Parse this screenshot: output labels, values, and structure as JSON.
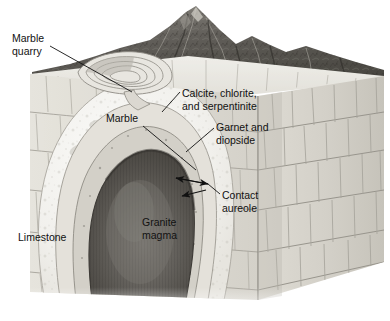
{
  "figure": {
    "background_color": "#ffffff",
    "style": "grayscale halftone textbook illustration"
  },
  "labels": [
    {
      "id": "marble-quarry",
      "text_line1": "Marble",
      "text_line2": "quarry",
      "x": 12,
      "y": 42,
      "anchor": "start"
    },
    {
      "id": "marble",
      "text_line1": "Marble",
      "text_line2": "",
      "x": 106,
      "y": 122,
      "anchor": "start"
    },
    {
      "id": "calcite",
      "text_line1": "Calcite, chlorite,",
      "text_line2": "and serpentinite",
      "x": 182,
      "y": 97,
      "anchor": "start"
    },
    {
      "id": "garnet",
      "text_line1": "Garnet and",
      "text_line2": "diopside",
      "x": 216,
      "y": 131,
      "anchor": "start"
    },
    {
      "id": "contact-aureole",
      "text_line1": "Contact",
      "text_line2": "aureole",
      "x": 222,
      "y": 199,
      "anchor": "start"
    },
    {
      "id": "granite-magma",
      "text_line1": "Granite",
      "text_line2": "magma",
      "x": 142,
      "y": 226,
      "anchor": "start"
    },
    {
      "id": "limestone",
      "text_line1": "Limestone",
      "text_line2": "",
      "x": 18,
      "y": 241,
      "anchor": "start"
    }
  ],
  "colors": {
    "label_text": "#111111",
    "leader_line": "#111111",
    "limestone_light": "#ebe9e4",
    "limestone_mid": "#d8d5ce",
    "limestone_shadow": "#c2bfb7",
    "marble_pale": "#f3f2ef",
    "aureole_band": "#cfccc4",
    "magma_dark": "#54514d",
    "magma_core": "#6d6a65",
    "mountain_dark": "#4a4843",
    "mountain_mid": "#6f6c66",
    "mountain_light": "#a6a29b"
  },
  "geology": {
    "units": [
      "Limestone (country rock, bedded)",
      "Marble (outer aureole, recrystallized limestone)",
      "Calcite, chlorite, and serpentinite (middle aureole)",
      "Garnet and diopside (inner aureole, highest grade)",
      "Granite magma (intrusive body)"
    ],
    "features": [
      "Marble quarry on land surface",
      "Contact aureole zone",
      "Mountain topography on block top"
    ]
  }
}
